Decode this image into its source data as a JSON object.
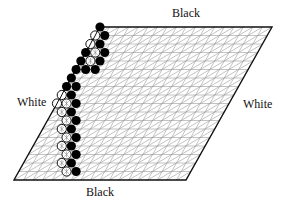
{
  "labels": {
    "top": "Black",
    "bottom": "Black",
    "left": "White",
    "right": "White"
  },
  "board": {
    "size": 18,
    "corners": {
      "top_left": [
        100,
        27
      ],
      "top_right": [
        272,
        27
      ],
      "bottom_right": [
        186,
        180
      ],
      "bottom_left": [
        14,
        180
      ]
    },
    "edge_color": "#111111",
    "grid_color": "#9a9a9a"
  },
  "stones": [
    {
      "row": 0,
      "col": 0,
      "type": "black"
    },
    {
      "row": 1,
      "col": 0,
      "type": "white-slash"
    },
    {
      "row": 1,
      "col": 1,
      "type": "black"
    },
    {
      "row": 2,
      "col": 0,
      "type": "white-slash"
    },
    {
      "row": 2,
      "col": 1,
      "type": "black"
    },
    {
      "row": 3,
      "col": 0,
      "type": "black"
    },
    {
      "row": 3,
      "col": 1,
      "type": "white-cross"
    },
    {
      "row": 3,
      "col": 2,
      "type": "black"
    },
    {
      "row": 4,
      "col": 0,
      "type": "black"
    },
    {
      "row": 4,
      "col": 1,
      "type": "white-cross"
    },
    {
      "row": 4,
      "col": 2,
      "type": "black"
    },
    {
      "row": 5,
      "col": 0,
      "type": "black"
    },
    {
      "row": 5,
      "col": 1,
      "type": "black"
    },
    {
      "row": 5,
      "col": 2,
      "type": "black"
    },
    {
      "row": 6,
      "col": 0,
      "type": "black"
    },
    {
      "row": 7,
      "col": 0,
      "type": "black"
    },
    {
      "row": 7,
      "col": 1,
      "type": "black"
    },
    {
      "row": 8,
      "col": 0,
      "type": "white-slash"
    },
    {
      "row": 8,
      "col": 1,
      "type": "black"
    },
    {
      "row": 9,
      "col": 0,
      "type": "white-slash"
    },
    {
      "row": 9,
      "col": 1,
      "type": "white-cross"
    },
    {
      "row": 9,
      "col": 2,
      "type": "black"
    },
    {
      "row": 10,
      "col": 1,
      "type": "white-cross"
    },
    {
      "row": 10,
      "col": 2,
      "type": "black"
    },
    {
      "row": 11,
      "col": 2,
      "type": "white-cross"
    },
    {
      "row": 11,
      "col": 3,
      "type": "black"
    },
    {
      "row": 12,
      "col": 2,
      "type": "white-cross"
    },
    {
      "row": 12,
      "col": 3,
      "type": "black"
    },
    {
      "row": 13,
      "col": 3,
      "type": "white-cross"
    },
    {
      "row": 13,
      "col": 4,
      "type": "black"
    },
    {
      "row": 14,
      "col": 3,
      "type": "white-cross"
    },
    {
      "row": 14,
      "col": 4,
      "type": "black"
    },
    {
      "row": 15,
      "col": 4,
      "type": "white-cross"
    },
    {
      "row": 15,
      "col": 5,
      "type": "black"
    },
    {
      "row": 16,
      "col": 4,
      "type": "white-cross"
    },
    {
      "row": 16,
      "col": 5,
      "type": "black"
    },
    {
      "row": 17,
      "col": 5,
      "type": "white-cross"
    },
    {
      "row": 17,
      "col": 6,
      "type": "black"
    }
  ]
}
